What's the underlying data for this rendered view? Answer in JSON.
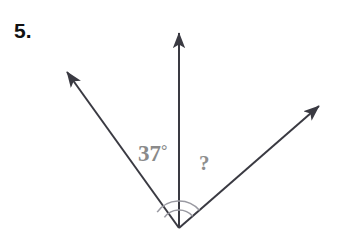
{
  "problem": {
    "number_label": "5."
  },
  "diagram": {
    "type": "angle-diagram",
    "background_color": "#ffffff",
    "ray_color": "#3a3a42",
    "ray_stroke_width": 2,
    "arc_color": "#9a9aa2",
    "arc_stroke_width": 1.6,
    "vertex": {
      "x": 179,
      "y": 228
    },
    "rays": [
      {
        "name": "left-ray",
        "tip": {
          "x": 62,
          "y": 65
        },
        "direction_degrees_from_east": 144,
        "has_arrowhead": true
      },
      {
        "name": "vertical-ray",
        "tip": {
          "x": 179,
          "y": 25
        },
        "direction_degrees_from_east": 90,
        "has_arrowhead": true
      },
      {
        "name": "right-ray",
        "tip": {
          "x": 327,
          "y": 99
        },
        "direction_degrees_from_east": 41,
        "has_arrowhead": true
      }
    ],
    "arcs": [
      {
        "name": "full-angle-arc",
        "radius": 27,
        "start_degrees_from_east": 41,
        "end_degrees_from_east": 144
      },
      {
        "name": "inner-angle-arc",
        "radius": 18,
        "start_degrees_from_east": 41,
        "end_degrees_from_east": 144
      }
    ],
    "labels": {
      "known_angle": {
        "value": "37",
        "degree_symbol": "°",
        "color": "#8a8a8a",
        "between_rays": [
          "left-ray",
          "vertical-ray"
        ]
      },
      "unknown_angle": {
        "value": "?",
        "color": "#8e8e8e",
        "between_rays": [
          "vertical-ray",
          "right-ray"
        ]
      }
    }
  }
}
